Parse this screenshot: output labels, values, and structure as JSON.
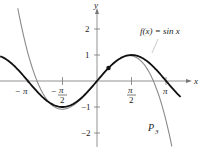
{
  "chart_data": {
    "type": "line",
    "title": "",
    "xlabel": "x",
    "ylabel": "y",
    "xlim": [
      -3.5,
      4.0
    ],
    "ylim": [
      -2.4,
      2.9
    ],
    "grid": false,
    "x_ticks": [
      "-π",
      "-π/2",
      "π/2",
      "π"
    ],
    "y_ticks": [
      "2",
      "1",
      "-1",
      "-2"
    ],
    "series": [
      {
        "name": "f(x) = sin x",
        "color": "#111111",
        "function": "sin(x)"
      },
      {
        "name": "P3",
        "color": "#8a8a8a",
        "function": "third-degree Taylor polynomial of sin x centered at π/6"
      }
    ],
    "point": {
      "x": 0.5236,
      "y": 0.5,
      "label": "(π/6, 1/2)"
    },
    "annotations": [
      "f(x) = sin x",
      "P3"
    ]
  },
  "labels": {
    "y_axis": "y",
    "x_axis": "x",
    "f_label": "f(x) = sin x",
    "p_label": "P",
    "p_sub": "3",
    "xt": {
      "neg_pi_minus": "−",
      "neg_pi": "π",
      "neg_half_minus": "−",
      "half_num": "π",
      "half_den": "2",
      "pi": "π"
    },
    "yt": {
      "two": "2",
      "one": "1",
      "neg_one": "−1",
      "neg_two": "−2"
    }
  }
}
